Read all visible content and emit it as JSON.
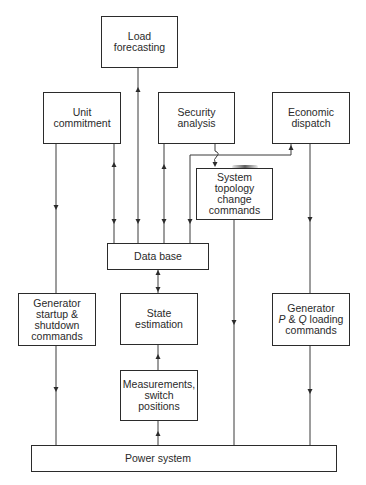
{
  "diagram": {
    "boxes": {
      "load_forecasting": {
        "lines": [
          "Load",
          "forecasting"
        ]
      },
      "unit_commitment": {
        "lines": [
          "Unit",
          "commitment"
        ]
      },
      "security_analysis": {
        "lines": [
          "Security",
          "analysis"
        ]
      },
      "economic_dispatch": {
        "lines": [
          "Economic",
          "dispatch"
        ]
      },
      "system_topology": {
        "lines": [
          "System",
          "topology",
          "change",
          "commands"
        ]
      },
      "data_base": {
        "lines": [
          "Data base"
        ]
      },
      "generator_startup": {
        "lines": [
          "Generator",
          "startup &",
          "shutdown",
          "commands"
        ]
      },
      "state_estimation": {
        "lines": [
          "State",
          "estimation"
        ]
      },
      "generator_pq": {
        "line1": "Generator",
        "p": "P",
        "amp": " & ",
        "q": "Q",
        "loading": " loading",
        "line3": "commands"
      },
      "measurements": {
        "lines": [
          "Measurements,",
          "switch",
          "positions"
        ]
      },
      "power_system": {
        "lines": [
          "Power system"
        ]
      }
    },
    "connections": [
      {
        "from": "Unit commitment",
        "to": "Generator startup & shutdown commands"
      },
      {
        "from": "Unit commitment",
        "to": "Data base",
        "bidirectional": true
      },
      {
        "from": "Load forecasting",
        "to": "Data base",
        "bidirectional": true
      },
      {
        "from": "Security analysis",
        "to": "Data base",
        "bidirectional": true
      },
      {
        "from": "Data base",
        "to": "Economic dispatch"
      },
      {
        "from": "Security analysis",
        "to": "System topology change commands"
      },
      {
        "from": "Economic dispatch",
        "to": "Generator P & Q loading commands"
      },
      {
        "from": "Data base",
        "to": "State estimation",
        "bidirectional": true
      },
      {
        "from": "Measurements, switch positions",
        "to": "State estimation"
      },
      {
        "from": "Power system",
        "to": "Measurements, switch positions"
      },
      {
        "from": "Generator startup & shutdown commands",
        "to": "Power system"
      },
      {
        "from": "System topology change commands",
        "to": "Power system"
      },
      {
        "from": "Generator P & Q loading commands",
        "to": "Power system"
      }
    ]
  }
}
